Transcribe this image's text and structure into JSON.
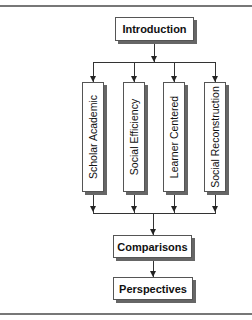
{
  "diagram": {
    "top": {
      "label": "Introduction"
    },
    "branches": [
      {
        "label": "Scholar Academic"
      },
      {
        "label": "Social Efficiency"
      },
      {
        "label": "Learner Centered"
      },
      {
        "label": "Social Reconstruction"
      }
    ],
    "middle": {
      "label": "Comparisons"
    },
    "bottom": {
      "label": "Perspectives"
    }
  }
}
